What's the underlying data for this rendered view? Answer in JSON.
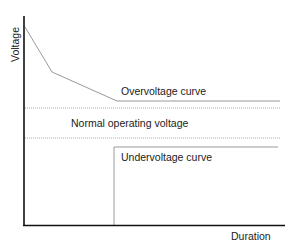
{
  "diagram": {
    "axes": {
      "y_label": "Voltage",
      "x_label": "Duration"
    },
    "labels": {
      "overvoltage": "Overvoltage curve",
      "normal": "Normal operating voltage",
      "undervoltage": "Undervoltage curve"
    },
    "colors": {
      "axis": "#111111",
      "curve": "#9a9a9a",
      "dotted": "#aaaaaa",
      "text": "#222222"
    }
  }
}
